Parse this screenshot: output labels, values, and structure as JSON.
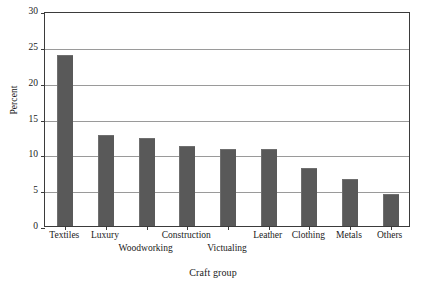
{
  "chart_data": {
    "type": "bar",
    "title": "",
    "subtitle": "",
    "xlabel": "Craft group",
    "ylabel": "Percent",
    "categories": [
      "Textiles",
      "Luxury",
      "Woodworking",
      "Construction",
      "Victualing",
      "Leather",
      "Clothing",
      "Metals",
      "Others"
    ],
    "values": [
      23.9,
      12.7,
      12.3,
      11.1,
      10.8,
      10.8,
      8.1,
      6.6,
      4.4
    ],
    "ylim": [
      0,
      30
    ],
    "ytick_labels": [
      "0",
      "5",
      "10",
      "15",
      "20",
      "25",
      "30"
    ],
    "ytick_values": [
      0,
      5,
      10,
      15,
      20,
      25,
      30
    ],
    "grid": true,
    "grid_axis": "y",
    "legend": false,
    "legend_position": "none",
    "label_stagger_rows": [
      0,
      0,
      1,
      0,
      1,
      0,
      0,
      0,
      0
    ],
    "colors": {
      "bar_fill": "#595959",
      "bar_edge": "#6f6f6f",
      "gridline": "#9a9a9a",
      "axis_frame": "#3b3b3b",
      "text": "#1a1a1a",
      "background": "#ffffff"
    }
  }
}
